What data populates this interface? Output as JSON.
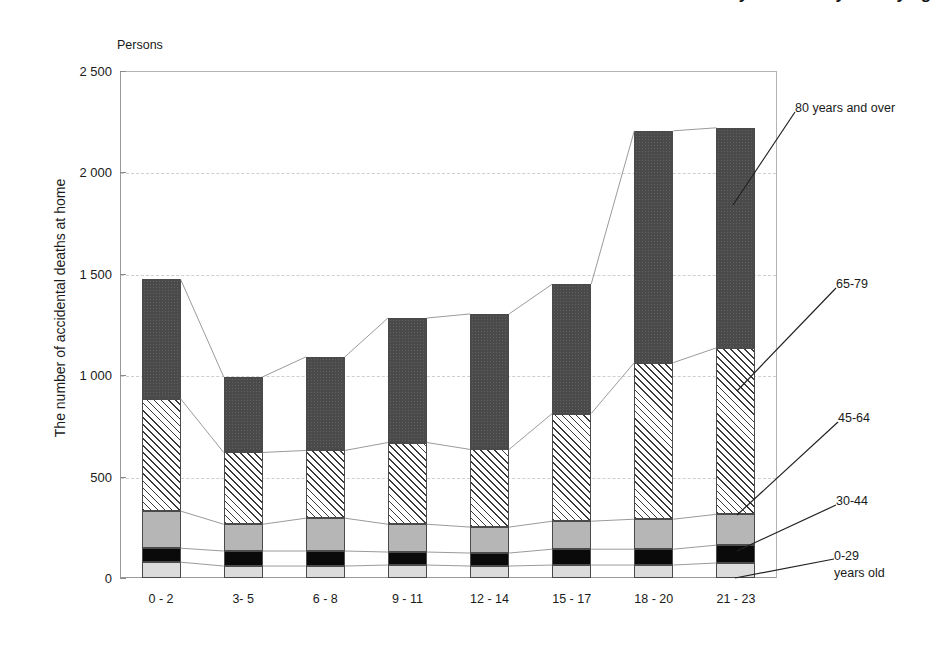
{
  "chart_data": {
    "type": "bar",
    "subtype": "stacked-bar",
    "title": "The number of accidental deaths at home by time of day and by age group",
    "unit_label": "Persons",
    "xlabel": "",
    "ylabel": "The number of accidental deaths at home",
    "categories": [
      "0 - 2",
      "3- 5",
      "6 - 8",
      "9 - 11",
      "12 - 14",
      "15 - 17",
      "18 - 20",
      "21 - 23"
    ],
    "ylim": [
      0,
      2500
    ],
    "yticks": [
      0,
      500,
      1000,
      1500,
      2000,
      2500
    ],
    "ytick_labels": [
      "0",
      "500",
      "1 000",
      "1 500",
      "2 000",
      "2 500"
    ],
    "grid": true,
    "grid_style": "horizontal dashed",
    "legend_position": "right callouts with leader lines",
    "series": [
      {
        "name": "0-29 years old",
        "fill": "light-gray",
        "color": "#dcdcdc",
        "values": [
          78,
          59,
          59,
          64,
          59,
          64,
          64,
          74
        ]
      },
      {
        "name": "30-44",
        "fill": "black",
        "color": "#0a0a0a",
        "values": [
          69,
          74,
          74,
          64,
          64,
          78,
          78,
          88
        ]
      },
      {
        "name": "45-64",
        "fill": "medium-gray",
        "color": "#b6b6b6",
        "values": [
          183,
          132,
          162,
          137,
          128,
          138,
          148,
          152
        ]
      },
      {
        "name": "65-79",
        "fill": "diagonal-hatch",
        "color": "#ffffff",
        "values": [
          554,
          354,
          334,
          403,
          383,
          531,
          772,
          821
        ]
      },
      {
        "name": "80 years and over",
        "fill": "dark-gray",
        "color": "#4a4a4a",
        "values": [
          589,
          373,
          461,
          614,
          668,
          638,
          1143,
          1085
        ]
      }
    ],
    "totals": [
      1473,
      992,
      1090,
      1282,
      1302,
      1449,
      2205,
      2220
    ]
  },
  "legend_callouts": [
    {
      "id": "cal-80",
      "label": "80 years and over"
    },
    {
      "id": "cal-65",
      "label": "65-79"
    },
    {
      "id": "cal-45",
      "label": "45-64"
    },
    {
      "id": "cal-30",
      "label": "30-44"
    },
    {
      "id": "cal-00",
      "label": "0-29",
      "label2": "years old"
    }
  ]
}
